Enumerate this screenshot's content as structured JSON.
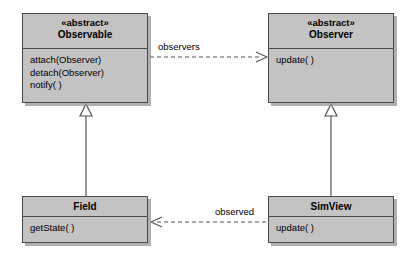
{
  "diagram": {
    "colors": {
      "box_fill": "#c3c3c3",
      "box_border": "#4a4a4a",
      "line": "#555555",
      "text": "#000000",
      "shadow": "#969696",
      "background": "#ffffff"
    },
    "classes": [
      {
        "id": "observable",
        "stereotype": "«abstract»",
        "name": "Observable",
        "operations": [
          "attach(Observer)",
          "detach(Observer)",
          "notify( )"
        ]
      },
      {
        "id": "observer",
        "stereotype": "«abstract»",
        "name": "Observer",
        "operations": [
          "update( )"
        ]
      },
      {
        "id": "field",
        "stereotype": "",
        "name": "Field",
        "operations": [
          "getState( )"
        ]
      },
      {
        "id": "simview",
        "stereotype": "",
        "name": "SimView",
        "operations": [
          "update( )"
        ]
      }
    ],
    "relationships": [
      {
        "id": "observers",
        "label": "observers",
        "type": "dashed-arrow",
        "from": "observable",
        "to": "observer"
      },
      {
        "id": "observed",
        "label": "observed",
        "type": "dashed-arrow",
        "from": "simview",
        "to": "field"
      },
      {
        "id": "field-inherits-observable",
        "label": "",
        "type": "generalization",
        "from": "field",
        "to": "observable"
      },
      {
        "id": "simview-inherits-observer",
        "label": "",
        "type": "generalization",
        "from": "simview",
        "to": "observer"
      }
    ]
  }
}
